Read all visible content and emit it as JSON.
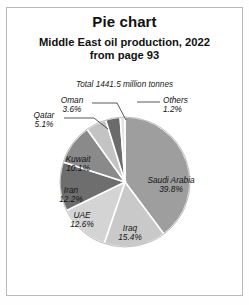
{
  "title": "Pie chart",
  "subtitle_line1": "Middle East oil production, 2022",
  "subtitle_line2": "from page 93",
  "note": "Total 1441.5 million tonnes",
  "chart_data": {
    "type": "pie",
    "title": "Middle East oil production, 2022",
    "subtitle": "from page 93",
    "annotation": "Total 1441.5 million tonnes",
    "total": 1441.5,
    "total_units": "million tonnes",
    "units": "percent",
    "start_angle_deg": 0,
    "direction": "clockwise",
    "legend": "none",
    "categories": [
      "Saudi Arabia",
      "Iraq",
      "UAE",
      "Iran",
      "Kuwait",
      "Qatar",
      "Oman",
      "Others"
    ],
    "values": [
      39.8,
      15.4,
      12.6,
      12.2,
      10.1,
      5.1,
      3.6,
      1.2
    ],
    "colors": [
      "#9e9e9e",
      "#c9c9c9",
      "#d4d4d4",
      "#6e6e6e",
      "#8a8a8a",
      "#c3c3c3",
      "#6b6b6b",
      "#e3e3e3"
    ],
    "slices": [
      {
        "label": "Saudi Arabia",
        "value": 39.8,
        "pct_text": "39.8%",
        "color": "#9e9e9e",
        "label_placement": "inside"
      },
      {
        "label": "Iraq",
        "value": 15.4,
        "pct_text": "15.4%",
        "color": "#c9c9c9",
        "label_placement": "inside"
      },
      {
        "label": "UAE",
        "value": 12.6,
        "pct_text": "12.6%",
        "color": "#d4d4d4",
        "label_placement": "inside"
      },
      {
        "label": "Iran",
        "value": 12.2,
        "pct_text": "12.2%",
        "color": "#6e6e6e",
        "label_placement": "inside"
      },
      {
        "label": "Kuwait",
        "value": 10.1,
        "pct_text": "10.1%",
        "color": "#8a8a8a",
        "label_placement": "inside"
      },
      {
        "label": "Qatar",
        "value": 5.1,
        "pct_text": "5.1%",
        "color": "#c3c3c3",
        "label_placement": "outside-leader"
      },
      {
        "label": "Oman",
        "value": 3.6,
        "pct_text": "3.6%",
        "color": "#6b6b6b",
        "label_placement": "outside-leader"
      },
      {
        "label": "Others",
        "value": 1.2,
        "pct_text": "1.2%",
        "color": "#e3e3e3",
        "label_placement": "outside-leader"
      }
    ]
  },
  "labels": {
    "saudi_name": "Saudi Arabia",
    "saudi_pct": "39.8%",
    "iraq_name": "Iraq",
    "iraq_pct": "15.4%",
    "uae_name": "UAE",
    "uae_pct": "12.6%",
    "iran_name": "Iran",
    "iran_pct": "12.2%",
    "kuwait_name": "Kuwait",
    "kuwait_pct": "10.1%",
    "qatar_name": "Qatar",
    "qatar_pct": "5.1%",
    "oman_name": "Oman",
    "oman_pct": "3.6%",
    "others_name": "Others",
    "others_pct": "1.2%"
  }
}
